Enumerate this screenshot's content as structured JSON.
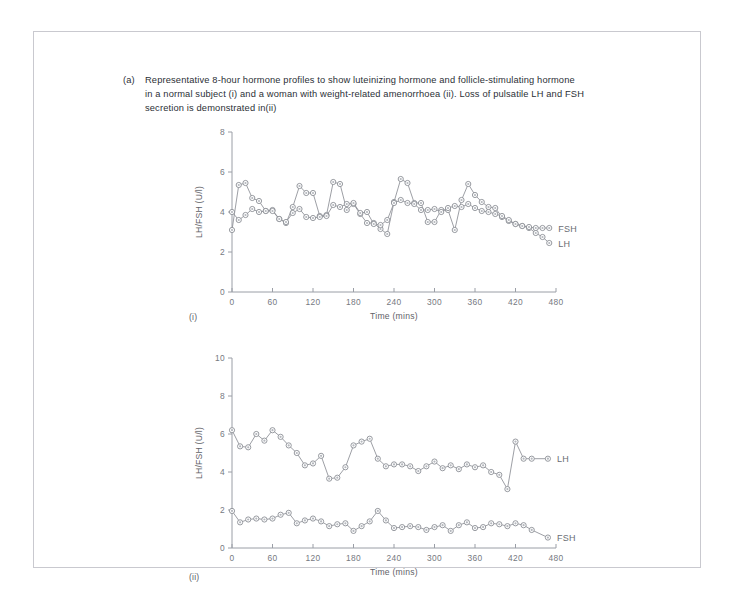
{
  "figure": {
    "caption_tag": "(a)",
    "caption_lines": [
      "Representative 8-hour hormone profiles to show luteinizing hormone and follicle-stimulating hormone",
      "in a normal subject (i) and a woman with weight-related amenorrhoea (ii). Loss of pulsatile LH and FSH",
      "secretion is demonstrated in(ii)"
    ],
    "panel_i_tag": "(i)",
    "panel_ii_tag": "(ii)",
    "line_color": "#8b8e95",
    "marker_fill": "#b4b7bd",
    "axis_color": "#9a9ea6",
    "text_color": "#2b2f36"
  },
  "chart_data": [
    {
      "type": "line",
      "panel": "(i)",
      "title": "",
      "xlabel": "Time (mins)",
      "ylabel": "LH/FSH (U/l)",
      "xlim": [
        0,
        480
      ],
      "ylim": [
        0,
        8
      ],
      "xticks": [
        0,
        60,
        120,
        180,
        240,
        300,
        360,
        420,
        480
      ],
      "yticks": [
        0,
        2,
        4,
        6,
        8
      ],
      "grid": false,
      "legend_position": "right-inline",
      "x": [
        0,
        10,
        20,
        30,
        40,
        50,
        60,
        70,
        80,
        90,
        100,
        110,
        120,
        130,
        140,
        150,
        160,
        170,
        180,
        190,
        200,
        210,
        220,
        230,
        240,
        250,
        260,
        270,
        280,
        290,
        300,
        310,
        320,
        330,
        340,
        350,
        360,
        370,
        380,
        390,
        400,
        410,
        420,
        430,
        440,
        450,
        460,
        470
      ],
      "series": [
        {
          "name": "LH",
          "values": [
            3.1,
            5.35,
            5.45,
            4.7,
            4.55,
            4.05,
            4.1,
            3.65,
            3.45,
            4.25,
            5.3,
            4.95,
            4.95,
            3.8,
            3.85,
            5.5,
            5.4,
            4.1,
            4.4,
            3.9,
            3.45,
            3.45,
            3.15,
            2.9,
            4.5,
            5.65,
            5.45,
            4.45,
            4.45,
            3.5,
            3.5,
            4.1,
            4.1,
            3.1,
            4.6,
            5.4,
            4.85,
            4.5,
            4.25,
            4.2,
            3.75,
            3.55,
            3.4,
            3.3,
            3.2,
            2.95,
            2.75,
            2.45
          ]
        },
        {
          "name": "FSH",
          "values": [
            4.0,
            3.6,
            3.85,
            4.15,
            4.0,
            4.05,
            4.05,
            3.65,
            3.5,
            3.95,
            4.15,
            3.75,
            3.7,
            3.75,
            3.8,
            4.35,
            4.25,
            4.4,
            4.45,
            3.95,
            4.0,
            3.4,
            3.35,
            3.6,
            4.45,
            4.6,
            4.45,
            4.4,
            4.1,
            4.1,
            4.15,
            4.0,
            4.2,
            4.3,
            4.25,
            4.4,
            4.2,
            4.05,
            4.0,
            3.9,
            3.8,
            3.6,
            3.4,
            3.3,
            3.25,
            3.2,
            3.2,
            3.2
          ]
        }
      ]
    },
    {
      "type": "line",
      "panel": "(ii)",
      "title": "",
      "xlabel": "Time (mins)",
      "ylabel": "LH/FSH (U/l)",
      "xlim": [
        0,
        480
      ],
      "ylim": [
        0,
        10
      ],
      "xticks": [
        0,
        60,
        120,
        180,
        240,
        300,
        360,
        420,
        480
      ],
      "yticks": [
        0,
        2,
        4,
        6,
        8,
        10
      ],
      "grid": false,
      "legend_position": "right-inline",
      "x": [
        0,
        12,
        24,
        36,
        48,
        60,
        72,
        84,
        96,
        108,
        120,
        132,
        144,
        156,
        168,
        180,
        192,
        204,
        216,
        228,
        240,
        252,
        264,
        276,
        288,
        300,
        312,
        324,
        336,
        348,
        360,
        372,
        384,
        396,
        408,
        420,
        432,
        444,
        468
      ],
      "series": [
        {
          "name": "LH",
          "values": [
            6.2,
            5.35,
            5.3,
            6.0,
            5.65,
            6.2,
            5.85,
            5.4,
            5.0,
            4.35,
            4.45,
            4.85,
            3.65,
            3.7,
            4.25,
            5.4,
            5.6,
            5.75,
            4.7,
            4.3,
            4.4,
            4.4,
            4.3,
            4.05,
            4.3,
            4.55,
            4.2,
            4.35,
            4.15,
            4.4,
            4.25,
            4.35,
            4.0,
            3.85,
            3.1,
            5.6,
            4.7,
            4.7,
            4.7
          ]
        },
        {
          "name": "FSH",
          "values": [
            1.95,
            1.35,
            1.5,
            1.55,
            1.5,
            1.55,
            1.75,
            1.85,
            1.3,
            1.45,
            1.55,
            1.4,
            1.15,
            1.25,
            1.3,
            0.9,
            1.15,
            1.4,
            1.95,
            1.45,
            1.05,
            1.1,
            1.15,
            1.1,
            0.95,
            1.1,
            1.2,
            0.9,
            1.2,
            1.35,
            1.05,
            1.1,
            1.3,
            1.25,
            1.15,
            1.3,
            1.2,
            0.95,
            0.55
          ]
        }
      ]
    }
  ]
}
